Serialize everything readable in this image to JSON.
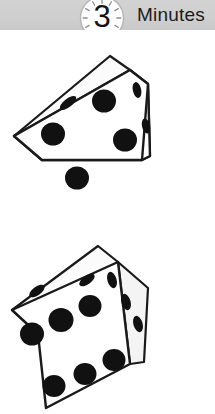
{
  "header": {
    "label": "Minutes",
    "clock": {
      "icon": "clock-face-icon",
      "value": "3",
      "tick_count": 12
    },
    "background_color": "#cfcfcf",
    "text_color": "#1c1c1c"
  },
  "scene": {
    "background_color": "#ffffff",
    "outline_color": "#1a1a1a",
    "pip_color": "#111111",
    "face_fill": "#ffffff",
    "face_shade": "#f2f2f2",
    "dice": [
      {
        "name": "die-upper",
        "faces": {
          "top": {
            "pips": 1
          },
          "front": {
            "pips": 4
          },
          "right": {
            "pips": 2
          }
        }
      },
      {
        "name": "die-lower",
        "faces": {
          "top": {
            "pips": 2
          },
          "front": {
            "pips": 6
          },
          "right": {
            "pips": 3
          }
        }
      }
    ]
  }
}
